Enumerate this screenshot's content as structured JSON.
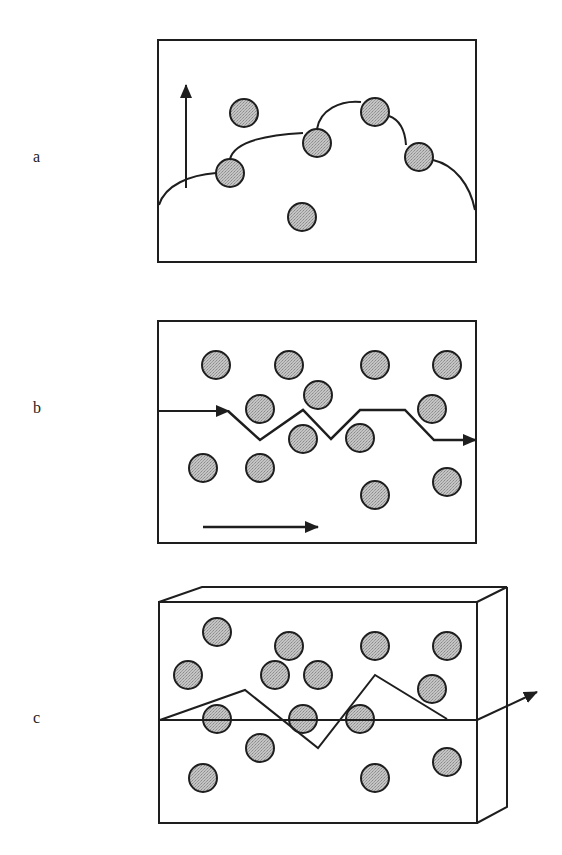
{
  "labels": {
    "a": "a",
    "b": "b",
    "c": "c"
  },
  "colors": {
    "stroke": "#1e1e1e",
    "particle_fill": "#b5b5b5",
    "background": "#ffffff"
  },
  "panels": {
    "a": {
      "description": "Front growth around particles, upward arrow",
      "box": [
        158,
        40,
        318,
        222
      ],
      "particles": [
        [
          244,
          113
        ],
        [
          317,
          143
        ],
        [
          375,
          112
        ],
        [
          230,
          173
        ],
        [
          419,
          157
        ],
        [
          302,
          217
        ]
      ],
      "arrow": {
        "from": [
          186,
          188
        ],
        "to": [
          186,
          85
        ]
      }
    },
    "b": {
      "description": "Zigzag path around particles, rightward arrow",
      "box": [
        158,
        321,
        318,
        222
      ],
      "particles": [
        [
          216,
          365
        ],
        [
          289,
          365
        ],
        [
          375,
          365
        ],
        [
          447,
          365
        ],
        [
          318,
          395
        ],
        [
          260,
          409
        ],
        [
          432,
          409
        ],
        [
          303,
          439
        ],
        [
          360,
          438
        ],
        [
          203,
          468
        ],
        [
          260,
          468
        ],
        [
          375,
          495
        ],
        [
          447,
          482
        ]
      ],
      "path": [
        [
          158,
          411
        ],
        [
          228,
          411
        ],
        [
          260,
          440
        ],
        [
          303,
          410
        ],
        [
          331,
          439
        ],
        [
          360,
          410
        ],
        [
          405,
          410
        ],
        [
          434,
          440
        ],
        [
          476,
          440
        ]
      ],
      "arrow": {
        "from": [
          203,
          527
        ],
        "to": [
          318,
          527
        ]
      }
    },
    "c": {
      "description": "3D box with zigzag crack path and exit arrow",
      "front": [
        159,
        602,
        318,
        221
      ],
      "particles": [
        [
          217,
          632
        ],
        [
          289,
          646
        ],
        [
          375,
          646
        ],
        [
          447,
          646
        ],
        [
          188,
          675
        ],
        [
          275,
          675
        ],
        [
          318,
          675
        ],
        [
          432,
          689
        ],
        [
          217,
          719
        ],
        [
          303,
          719
        ],
        [
          360,
          719
        ],
        [
          260,
          748
        ],
        [
          447,
          762
        ],
        [
          203,
          778
        ],
        [
          375,
          778
        ]
      ],
      "plane_y": 720,
      "path": [
        [
          160,
          720
        ],
        [
          245,
          690
        ],
        [
          318,
          748
        ],
        [
          375,
          675
        ],
        [
          447,
          719
        ]
      ],
      "arrow": {
        "from": [
          477,
          720
        ],
        "to": [
          537,
          692
        ]
      }
    }
  }
}
